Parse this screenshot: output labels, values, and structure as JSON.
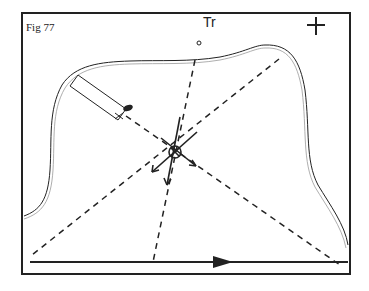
{
  "figure": {
    "label": "Fig 77",
    "landmark_label": "Tr",
    "colors": {
      "ink": "#222222",
      "background": "#ffffff",
      "outline_light": "#999999"
    }
  },
  "symbols": {
    "north": "plus-marker",
    "center": "circle-with-cross-and-arrows",
    "boat": "rectangle-with-x",
    "direction": "arrow-right"
  }
}
